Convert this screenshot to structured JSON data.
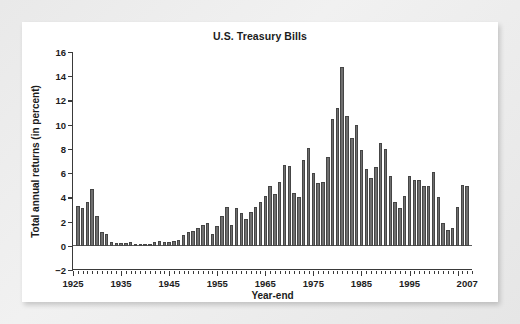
{
  "chart_data": {
    "type": "bar",
    "title": "U.S. Treasury Bills",
    "xlabel": "Year-end",
    "ylabel": "Total annual returns (in percent)",
    "ylim": [
      -2,
      16
    ],
    "ytick_labels": [
      "16",
      "14",
      "12",
      "10",
      "8",
      "6",
      "4",
      "2",
      "0",
      "−2"
    ],
    "ytick_values": [
      16,
      14,
      12,
      10,
      8,
      6,
      4,
      2,
      0,
      -2
    ],
    "xtick_labels": [
      "1925",
      "1935",
      "1945",
      "1955",
      "1965",
      "1975",
      "1985",
      "1995",
      "2007"
    ],
    "xtick_values": [
      1925,
      1935,
      1945,
      1955,
      1965,
      1975,
      1985,
      1995,
      2007
    ],
    "xlim": [
      1925,
      2008
    ],
    "grid": false,
    "legend": null,
    "bar_color": "#6f6f6f",
    "bar_edge_color": "#454545",
    "categories": [
      1926,
      1927,
      1928,
      1929,
      1930,
      1931,
      1932,
      1933,
      1934,
      1935,
      1936,
      1937,
      1938,
      1939,
      1940,
      1941,
      1942,
      1943,
      1944,
      1945,
      1946,
      1947,
      1948,
      1949,
      1950,
      1951,
      1952,
      1953,
      1954,
      1955,
      1956,
      1957,
      1958,
      1959,
      1960,
      1961,
      1962,
      1963,
      1964,
      1965,
      1966,
      1967,
      1968,
      1969,
      1970,
      1971,
      1972,
      1973,
      1974,
      1975,
      1976,
      1977,
      1978,
      1979,
      1980,
      1981,
      1982,
      1983,
      1984,
      1985,
      1986,
      1987,
      1988,
      1989,
      1990,
      1991,
      1992,
      1993,
      1994,
      1995,
      1996,
      1997,
      1998,
      1999,
      2000,
      2001,
      2002,
      2003,
      2004,
      2005,
      2006,
      2007
    ],
    "values": [
      3.3,
      3.1,
      3.6,
      4.7,
      2.5,
      1.1,
      1.0,
      0.3,
      0.2,
      0.2,
      0.2,
      0.3,
      0.0,
      0.0,
      0.0,
      0.1,
      0.3,
      0.4,
      0.3,
      0.3,
      0.4,
      0.5,
      0.9,
      1.1,
      1.2,
      1.5,
      1.7,
      1.9,
      1.0,
      1.6,
      2.5,
      3.2,
      1.7,
      3.1,
      2.7,
      2.2,
      2.8,
      3.2,
      3.6,
      4.1,
      4.9,
      4.3,
      5.3,
      6.7,
      6.6,
      4.4,
      4.0,
      7.1,
      8.1,
      6.0,
      5.2,
      5.3,
      7.3,
      10.5,
      11.4,
      14.8,
      10.7,
      8.9,
      10.0,
      7.9,
      6.3,
      5.6,
      6.5,
      8.5,
      8.0,
      5.8,
      3.6,
      3.1,
      4.1,
      5.8,
      5.4,
      5.4,
      4.9,
      4.9,
      6.1,
      4.0,
      1.9,
      1.3,
      1.5,
      3.2,
      5.0,
      4.9
    ]
  },
  "page": {
    "chart_title_label": "U.S. Treasury Bills",
    "x_axis_title_label": "Year-end",
    "y_axis_title_label": "Total annual returns (in percent)"
  }
}
